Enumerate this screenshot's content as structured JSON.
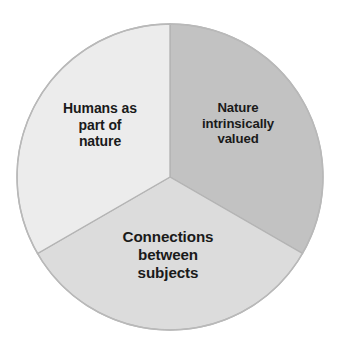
{
  "chart_data": {
    "type": "pie",
    "title": "",
    "subtitle": "",
    "xlabel": "",
    "ylabel": "",
    "grid": false,
    "legend_position": "none",
    "labels_inside_slices": true,
    "start_angle_deg": 0,
    "direction": "clockwise",
    "categories": [
      "Nature intrinsically valued",
      "Connections between subjects",
      "Humans as part of nature"
    ],
    "values": [
      33.33,
      33.33,
      33.33
    ],
    "slices": [
      {
        "label": "Nature\nintrinsically\nvalued",
        "label_plain": "Nature intrinsically valued",
        "value": 33.33,
        "angle_deg": 120,
        "start_deg": 0,
        "end_deg": 120,
        "color": "#c2c2c2"
      },
      {
        "label": "Connections\nbetween\nsubjects",
        "label_plain": "Connections between subjects",
        "value": 33.33,
        "angle_deg": 120,
        "start_deg": 120,
        "end_deg": 240,
        "color": "#dcdcdc"
      },
      {
        "label": "Humans as\npart of\nnature",
        "label_plain": "Humans as part of nature",
        "value": 33.33,
        "angle_deg": 120,
        "start_deg": 240,
        "end_deg": 360,
        "color": "#ececec"
      }
    ]
  },
  "style": {
    "background": "#ffffff",
    "stroke": "#b4b4b4",
    "text_color": "#1a1a1a",
    "center_x": 170,
    "center_y": 177,
    "radius": 153
  }
}
